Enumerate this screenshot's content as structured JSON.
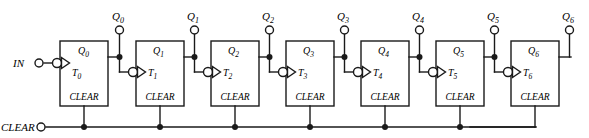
{
  "diagram": {
    "type": "logic-circuit-schematic",
    "colors": {
      "line": "#1a1a1a",
      "background": "#ffffff",
      "text": "#000000"
    },
    "input_label": "IN",
    "clear_bus_label": "CLEAR",
    "flipflops": [
      {
        "index": 0,
        "t_label": "T",
        "t_sub": "0",
        "q_label": "Q",
        "q_sub": "0",
        "clear_label": "CLEAR",
        "terminal_label": "Q",
        "terminal_sub": "0"
      },
      {
        "index": 1,
        "t_label": "T",
        "t_sub": "1",
        "q_label": "Q",
        "q_sub": "1",
        "clear_label": "CLEAR",
        "terminal_label": "Q",
        "terminal_sub": "1"
      },
      {
        "index": 2,
        "t_label": "T",
        "t_sub": "2",
        "q_label": "Q",
        "q_sub": "2",
        "clear_label": "CLEAR",
        "terminal_label": "Q",
        "terminal_sub": "2"
      },
      {
        "index": 3,
        "t_label": "T",
        "t_sub": "3",
        "q_label": "Q",
        "q_sub": "3",
        "clear_label": "CLEAR",
        "terminal_label": "Q",
        "terminal_sub": "3"
      },
      {
        "index": 4,
        "t_label": "T",
        "t_sub": "4",
        "q_label": "Q",
        "q_sub": "4",
        "clear_label": "CLEAR",
        "terminal_label": "Q",
        "terminal_sub": "4"
      },
      {
        "index": 5,
        "t_label": "T",
        "t_sub": "5",
        "q_label": "Q",
        "q_sub": "5",
        "clear_label": "CLEAR",
        "terminal_label": "Q",
        "terminal_sub": "5"
      },
      {
        "index": 6,
        "t_label": "T",
        "t_sub": "6",
        "q_label": "Q",
        "q_sub": "6",
        "clear_label": "CLEAR",
        "terminal_label": "Q",
        "terminal_sub": "6"
      }
    ]
  }
}
